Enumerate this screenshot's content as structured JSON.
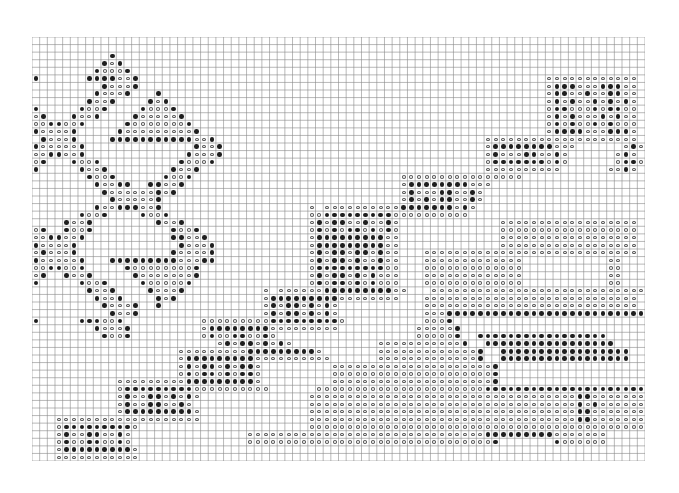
{
  "chart_data": {
    "type": "heatmap",
    "title": "",
    "cols": 80,
    "rows_count": 56,
    "legend": {
      "filled": "#",
      "open": "o",
      "blank": "."
    },
    "colors": {
      "grid": "#8a8a8a",
      "filled": "#1e1e1e",
      "open": "#555555",
      "background": "#ffffff"
    },
    "rows": [
      "................................................................................",
      "................................................................................",
      "..........#.....................................................................",
      ".........#o#....................................................................",
      "........#ooo#...................................................................",
      "#......####oo#.....................................................oooooooooooo.",
      ".........#ooo#.....................................................o###ooo###oo.",
      "........#ooo#...#..................................................o##oo#oo##oo.",
      ".......#oo#....#o#.................................................o#o#oo#o#o#o.",
      "#.....#oo#....#ooo#................................................o##ooo#o##oo.",
      "o#...#oo#....#ooooo#...............................................o#o#ooo#o#oo.",
      "oo##oo#.....#ooooooo#..............................................o#o#oo#o#ooo.",
      "#oooo#.....#ooooooooo#.............................................o####ooo###o.",
      ".#ooo#....###########oo#...................................oooooooooooooooooooo..",
      "#ooooo#..............#oo#..................................o########ooo......o#o.",
      "oo##oo#.............#ooo#..................................o#ooo##oo#o......o#o.",
      "o#...#oo#..........#ooo#...................................o#######o#o......o##o",
      "#.....#oo#........#oo#.....................................oooooooooo......oo#o",
      ".......#oo#......#oo#...........................oooooooooooooooo................",
      "........#oo##..##oo#............................o########ooo....................",
      ".........#oooooo#o#.............................o#ooo##oo#o.....................",
      "..........#ooooo#...............................o#o#o##oo#o.....................",
      "........#oo###oo#...................o oooooooooo#######o#o.......................",
      "......#oo#....#oo#..................oo#########oooooooooo........................",
      "....#oo#........#oo#................o#o##oo#oo#o.............oooooooooooooooooo..",
      "o#..#oo#..........#oo#..............o#o#o##o#o#o.............oooooooooooooooooo..",
      "oo##oo#...........##oo#.............o#########oo.............oooooooooooooooooo..",
      "#oooo#.............#ooo#............o#########oo.............oooooooooooooooooo..",
      "o#ooo#............#oooo#............o#o##o##o#oo...oooooooooooooooooooooooooooo..",
      "#ooooo#...#########ooo##............o#o##o#oo#oo...ooooooooooooo...........oo...",
      "oo##oo#.....#oooooooo#..............o#########oo...ooooooooooooo...........oo...",
      "o#..#oo#.....#ooooooo#..............o#o##o#o#ooo...ooooooooooooo...........oo...",
      "#.....#oo#....#ooooo#...............o#o##o#o#ooo...ooooooooooooo...........oo...",
      ".......#oo#....#ooo#..........o oooooo#########oo...oooooooooooooooooooooooooooo.",
      "........#oo#....#o#...........o#########oooooooo...oooooooooooooooooooooooooooo.",
      ".........#ooo#..#.............o#o##o#o#o...........oooooooooooooooooooooooooooo.",
      "..........#oo#................o#o##o#o#o...........ooo##########################.",
      "#.....###oo#..........ooooooooo#########o..........ooo#..........................",
      "........#ooo#.........o########ooooooooo..........ooooo#.........................",
      ".........#oo#.........o#oo##oo#o..................ooooo#..#################......",
      "........................o#o##o#o#o...........ooooooooooo#..#################.....",
      "...................ooooooooo#########o.......ooooooooooooo#..#################....",
      "...................o#########oooooooooo......ooooooooooooo#..#################....",
      "...................o#o##o#o##o.........ooooooooooooooooooooo#........................",
      "...................o#o##o#o##o.........ooooooooooooooooooooo#.......................",
      "...........ooooooooo#########o.........ooooooooooooooooooooo#.......................",
      "...........o#########oooooooooo......oooooooooooooooooooooo###############################",
      "...........o#oo##o#o#o..............ooooooooooooooooooooooooooooooooooo##oooooooooooo",
      "...........o#oo##oo#o...............ooooooooooooooooooooooooooooooooooo#o#ooooooooo",
      "...........o#########o..............ooooooooooooooooooooooooooooooooooo##oooooooooo",
      "...ooooooooooooooooooo..............ooooooooooooooooooooooooooooooooooo##oooooooooo",
      "...o#########o......................oooooooooooooooooooooooooooooooooooooooooooooo",
      "...o#oo##oo#o...............ooooooooooooooooooooooooooooooo#########ooooooo......o",
      "...o#oo##oo#o...............oooooooooooooooooooooooooooooooo#.......#oooooo......o",
      "...o#########o...............................................................",
      "...ooooooooooo.................................................................."
    ]
  }
}
